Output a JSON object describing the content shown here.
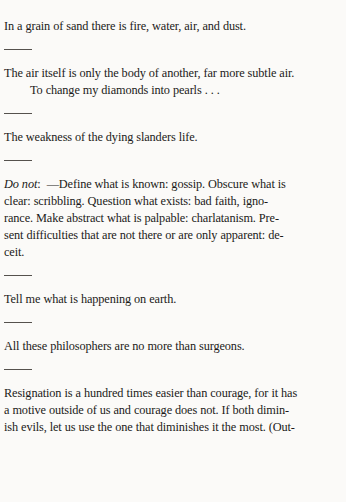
{
  "page": {
    "background_color": "#fbfaf8",
    "ink_color": "#1c1a18",
    "rule_color": "#55514d",
    "type": "scanned-book-page",
    "separator_glyph": "horizontal-rule"
  },
  "entries": [
    {
      "id": "entry-1",
      "kind": "aphorism",
      "lines": [
        "In a grain of sand there is fire, water, air, and dust."
      ]
    },
    {
      "id": "entry-2",
      "kind": "aphorism",
      "lines": [
        "The air itself is only the body of another, far more subtle air.",
        "To change my diamonds into pearls . . ."
      ],
      "indented_lines": [
        1
      ]
    },
    {
      "id": "entry-3",
      "kind": "aphorism",
      "lines": [
        "The weakness of the dying slanders life."
      ]
    },
    {
      "id": "entry-4",
      "kind": "aphorism-paragraph",
      "lead_italic": "Do not",
      "lead_rest": ":  —Define what is known: gossip. Obscure what is",
      "lines": [
        "clear: scribbling. Question what exists: bad faith, igno-",
        "rance. Make abstract what is palpable: charlatanism. Pre-",
        "sent difficulties that are not there or are only apparent: de-",
        "ceit."
      ]
    },
    {
      "id": "entry-5",
      "kind": "aphorism",
      "lines": [
        "Tell me what is happening on earth."
      ]
    },
    {
      "id": "entry-6",
      "kind": "aphorism",
      "lines": [
        "All these philosophers are no more than surgeons."
      ]
    },
    {
      "id": "entry-7",
      "kind": "aphorism-paragraph",
      "lines": [
        "Resignation is a hundred times easier than courage, for it has",
        "a motive outside of us and courage does not. If both dimin-",
        "ish evils, let us use the one that diminishes it the most. (Out-"
      ]
    }
  ]
}
